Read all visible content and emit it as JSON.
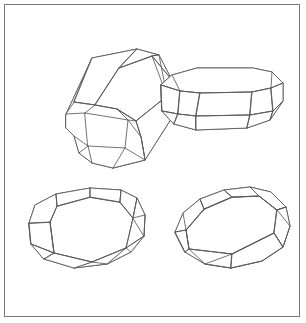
{
  "plate": {
    "title": "Crystal habit line drawings",
    "background_color": "#ffffff",
    "frame_color": "#777777",
    "line_color": "#5a5a5a",
    "width": 306,
    "height": 323,
    "figure_count": 4,
    "style": "ink line drawing, no shading, no labels"
  },
  "figures": [
    {
      "id": "figure-top-left",
      "name": "elongated-prismatic-crystal",
      "position": "top-left",
      "description": "Elongated bevelled rectangular prism seen in three-quarter view with octagonal truncated end face visible at lower left",
      "visible_faces": 9,
      "outline": "66,114 92,58 137,49 159,55 172,80 171,119 145,160 113,168 92,163 79,153 74,136 66,128",
      "edges": [
        "66,114 95,105 117,109 136,121 141,137",
        "95,105 119,68 152,56",
        "119,68 137,49",
        "136,121 167,96 172,80",
        "117,109 113,168",
        "141,137 145,160",
        "95,105 92,163",
        "66,128 79,153",
        "74,136 113,168",
        "92,58 95,105",
        "43,120 46,128"
      ],
      "end_face": {
        "name": "truncated-octagonal-termination",
        "outer": "66,114 74,102 95,105 117,109 136,121 141,137 145,160 113,168 92,163 79,153 74,136 66,128",
        "inner_rect": "85,113 128,120 125,148 88,146",
        "bevels": [
          "66,114 85,113",
          "95,105 85,113",
          "136,121 128,120",
          "141,137 128,120",
          "145,160 125,148",
          "113,168 125,148",
          "79,153 88,146",
          "74,136 88,146",
          "92,163 88,146",
          "117,109 128,120"
        ]
      }
    },
    {
      "id": "figure-top-right",
      "name": "tabular-bevelled-crystal",
      "position": "top-right",
      "description": "Low tabular octagonal crystal with bevelled top and bottom edges, viewed slightly from above",
      "visible_faces": 11,
      "outline": "161,85 172,75 197,68 253,68 272,72 283,83 283,101 270,120 247,128 196,130 174,124 162,111",
      "edges": [
        "161,85 180,91 200,93 252,92 271,88 283,83",
        "180,91 178,114",
        "200,93 196,116",
        "252,92 250,115",
        "271,88 273,111",
        "180,91 172,75",
        "271,88 272,72",
        "178,114 174,124",
        "196,116 196,130",
        "250,115 247,128",
        "273,111 270,120",
        "162,111 178,114 196,116 250,115 273,111 283,101",
        "161,85 162,111"
      ],
      "top_face": "161,85 180,91 200,93 252,92 271,88 283,83 272,72 253,68 197,68 172,75",
      "girdle_faces": [
        "180,91 200,93 196,116 178,114",
        "200,93 252,92 250,115 196,116",
        "252,92 271,88 273,111 250,115"
      ],
      "lower_bevels": [
        "178,114 196,116 196,130 174,124",
        "196,116 250,115 247,128 196,130",
        "250,115 273,111 270,120 247,128",
        "162,111 178,114 174,124",
        "273,111 283,101 270,120"
      ]
    },
    {
      "id": "figure-bottom-left",
      "name": "equant-dodecahedral-crystal",
      "position": "bottom-left",
      "description": "Broad equant crystal with large hexagonal top face and bevelled girdle of trapezoidal faces all around",
      "visible_faces": 12,
      "outline": "29,223 35,205 56,194 90,188 121,190 137,198 145,215 144,236 131,252 107,264 74,268 44,259 31,244",
      "edges": [
        "29,223 50,222 57,206 90,197 120,202 133,218 145,215",
        "50,222 54,253",
        "57,206 56,194",
        "90,197 90,188",
        "120,202 121,190",
        "133,218 137,198",
        "50,222 54,253 92,262 126,248 133,218",
        "92,262 107,264",
        "126,248 131,252",
        "54,253 44,259",
        "29,223 31,244 54,253",
        "144,236 126,248",
        "145,215 144,236"
      ],
      "top_face": "50,222 57,206 90,197 120,202 133,218 126,248 92,262 54,253",
      "girdle_faces": [
        "29,223 50,222 54,253 31,244",
        "57,206 56,194 90,188 90,197",
        "90,197 90,188 121,190 120,202",
        "120,202 121,190 137,198 133,218",
        "133,218 137,198 145,215 144,236",
        "126,248 144,236 131,252 107,264",
        "92,262 126,248 107,264 74,268",
        "54,253 92,262 74,268 44,259",
        "29,223 35,205 56,194 57,206 50,222"
      ]
    },
    {
      "id": "figure-bottom-right",
      "name": "blocky-bevelled-cube-crystal",
      "position": "bottom-right",
      "description": "Blocky cube-like crystal with truncated corners, large quadrilateral top face and two visible side faces",
      "visible_faces": 10,
      "outline": "175,232 183,213 200,199 224,190 250,187 271,192 286,207 290,226 283,247 262,261 231,268 205,264 185,252",
      "edges": [
        "175,232 186,230 204,209 232,197 259,196 277,210 286,207",
        "186,230 189,249",
        "204,209 200,199",
        "232,197 224,190",
        "259,196 250,187",
        "277,210 286,207",
        "186,230 189,249 232,254 274,233 277,210",
        "204,209 232,197 259,196 277,210",
        "186,230 204,209",
        "189,249 185,252",
        "232,254 231,268",
        "274,233 283,247",
        "277,210 290,226 283,247",
        "175,232 185,252",
        "232,254 205,264",
        "189,249 205,264 231,268 262,261 283,247 274,233 232,254"
      ],
      "top_face": "186,230 204,209 232,197 259,196 277,210 274,233 232,254 189,249",
      "front_faces": [
        "189,249 232,254 231,268 205,264 185,252",
        "232,254 274,233 283,247 262,261 231,268"
      ],
      "side_bevels": [
        "175,232 186,230 189,249 185,252",
        "277,210 286,207 290,226 283,247 274,233"
      ]
    }
  ]
}
